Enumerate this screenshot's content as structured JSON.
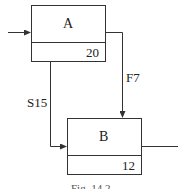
{
  "diagram": {
    "type": "activity-network",
    "nodes": [
      {
        "id": "A",
        "label": "A",
        "value": "20"
      },
      {
        "id": "B",
        "label": "B",
        "value": "12"
      }
    ],
    "edges": [
      {
        "from": "input",
        "to": "A",
        "label": ""
      },
      {
        "from": "A",
        "to": "B",
        "label": "F7"
      },
      {
        "from": "A",
        "to": "B",
        "label": "S15"
      },
      {
        "from": "B",
        "to": "output",
        "label": ""
      }
    ],
    "caption": "Fig. 14.2"
  },
  "colors": {
    "stroke": "#333333",
    "text": "#222222",
    "background": "#ffffff"
  }
}
